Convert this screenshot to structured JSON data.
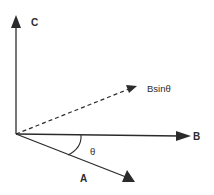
{
  "diagram": {
    "type": "vector-diagram",
    "colors": {
      "stroke": "#2b2b2b",
      "background": "#ffffff"
    },
    "origin": [
      16,
      134
    ],
    "vectors": [
      {
        "id": "C",
        "label": "C",
        "style": "solid",
        "from": [
          16,
          134
        ],
        "to": [
          16,
          17
        ]
      },
      {
        "id": "B",
        "label": "B",
        "style": "solid",
        "from": [
          16,
          134
        ],
        "to": [
          189,
          136
        ]
      },
      {
        "id": "Bsin",
        "label": "Bsinθ",
        "style": "dashed",
        "from": [
          16,
          134
        ],
        "to": [
          136,
          86
        ]
      },
      {
        "id": "A",
        "label": "A",
        "style": "solid",
        "from": [
          16,
          134
        ],
        "to": [
          134,
          181
        ]
      }
    ],
    "angle": {
      "label": "θ",
      "between": [
        "B",
        "A"
      ]
    }
  },
  "labels": {
    "c": "C",
    "b": "B",
    "bsin": "Bsinθ",
    "a": "A",
    "theta": "θ"
  }
}
